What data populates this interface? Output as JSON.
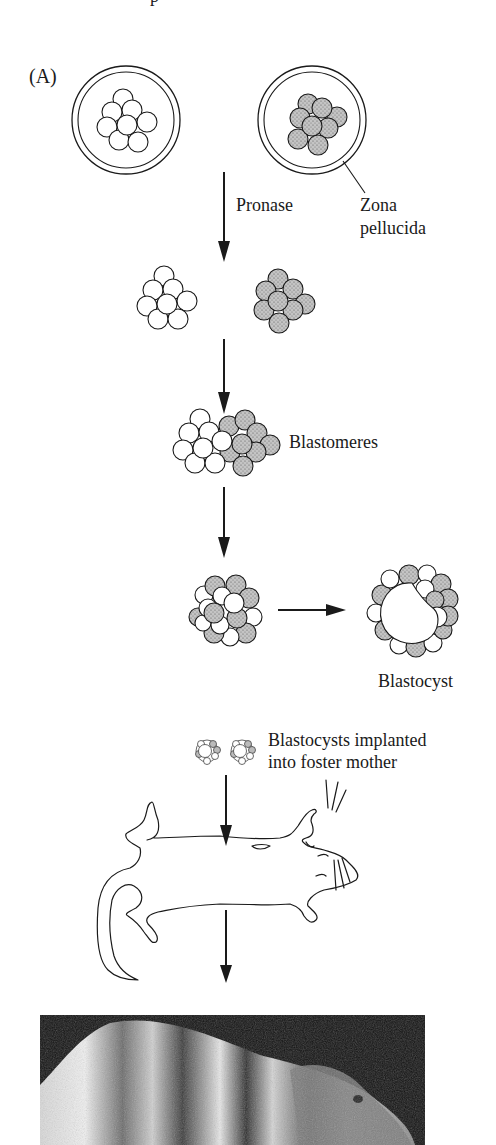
{
  "figure": {
    "panel_label": "(A)",
    "top_fragment": "p",
    "labels": {
      "pronase": "Pronase",
      "zona_line1": "Zona",
      "zona_line2": "pellucida",
      "blastomeres": "Blastomeres",
      "blastocyst": "Blastocyst",
      "implant_line1": "Blastocysts implanted",
      "implant_line2": "into foster mother"
    },
    "stages": [
      "Two 8-cell embryos in zona pellucida (white and stippled)",
      "Zona removed by pronase",
      "Blastomeres aggregated",
      "Chimeric morula",
      "Blastocyst",
      "Blastocysts implanted into foster mother",
      "Chimeric mouse (photograph)"
    ],
    "colors": {
      "stroke": "#1a1a1a",
      "stipple_fill": "#b8b8b8",
      "white_cell": "#ffffff",
      "photo_bg": "#111111"
    }
  }
}
